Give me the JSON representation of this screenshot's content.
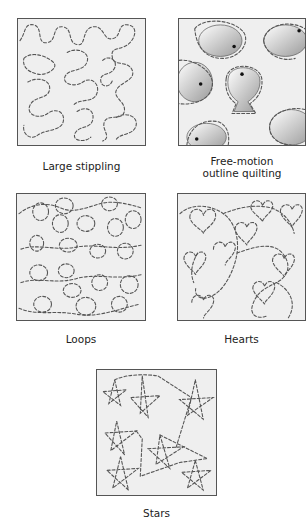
{
  "figure": {
    "panels": [
      {
        "id": "large-stippling",
        "label": "Large stippling"
      },
      {
        "id": "free-motion-outline",
        "label_line1": "Free-motion",
        "label_line2": "outline quilting"
      },
      {
        "id": "loops",
        "label": "Loops"
      },
      {
        "id": "hearts",
        "label": "Hearts"
      },
      {
        "id": "stars",
        "label": "Stars"
      }
    ]
  }
}
